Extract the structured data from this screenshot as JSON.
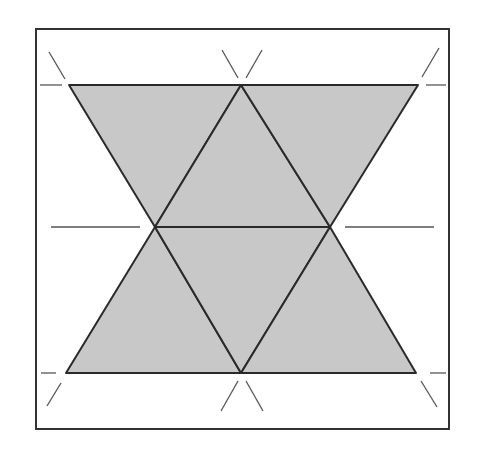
{
  "diagram": {
    "colors": {
      "background": "#ffffff",
      "fill": "#c8c8c8",
      "stroke": "#2a2a2a",
      "tick": "#555555",
      "frame": "#333333"
    },
    "frame": {
      "x": 36,
      "y": 29,
      "width": 413,
      "height": 400
    },
    "vertices": {
      "top_left": [
        69,
        85
      ],
      "top_mid": [
        241,
        85
      ],
      "top_right": [
        418,
        85
      ],
      "mid_left": [
        155,
        227
      ],
      "mid_right": [
        330,
        227
      ],
      "bottom_left": [
        66,
        373
      ],
      "bottom_mid": [
        241,
        373
      ],
      "bottom_right": [
        416,
        373
      ]
    },
    "triangle_count": 6
  }
}
